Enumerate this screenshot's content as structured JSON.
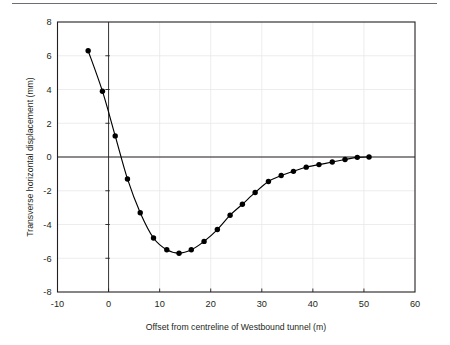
{
  "figure": {
    "top_rule": "horizontal-rule",
    "background_color": "#ffffff"
  },
  "chart_data": {
    "type": "line",
    "title": "",
    "subtitle": "",
    "xlabel": "Offset from centreline of Westbound tunnel (m)",
    "ylabel": "Transverse horizontal displacement (mm)",
    "xlim": [
      -10,
      60
    ],
    "ylim": [
      -8,
      8
    ],
    "xticks": [
      -10,
      0,
      10,
      20,
      30,
      40,
      50,
      60
    ],
    "xtick_labels": [
      "-10",
      "0",
      "10",
      "20",
      "30",
      "40",
      "50",
      "60"
    ],
    "yticks": [
      -8,
      -6,
      -4,
      -2,
      0,
      2,
      4,
      6,
      8
    ],
    "ytick_labels": [
      "-8",
      "-6",
      "-4",
      "-2",
      "0",
      "2",
      "4",
      "6",
      "8"
    ],
    "grid": true,
    "grid_color": "#e8e8e8",
    "legend": "none",
    "series": [
      {
        "name": "Transverse horizontal displacement",
        "marker": "filled-circle",
        "marker_color": "#000000",
        "line_color": "#000000",
        "x": [
          -4.0,
          -1.2,
          1.3,
          3.7,
          6.2,
          8.8,
          11.4,
          13.8,
          16.2,
          18.7,
          21.3,
          23.8,
          26.2,
          28.7,
          31.3,
          33.8,
          36.2,
          38.7,
          41.2,
          43.8,
          46.3,
          48.7,
          51.0
        ],
        "y": [
          6.3,
          3.9,
          1.25,
          -1.3,
          -3.3,
          -4.8,
          -5.5,
          -5.7,
          -5.5,
          -5.0,
          -4.3,
          -3.45,
          -2.8,
          -2.1,
          -1.45,
          -1.1,
          -0.85,
          -0.6,
          -0.45,
          -0.3,
          -0.15,
          -0.02,
          0.0
        ]
      }
    ]
  },
  "axes": {
    "x_axis_label": "Offset from centreline of Westbound tunnel (m)",
    "y_axis_label": "Transverse horizontal displacement (mm)",
    "zero_line_horizontal": "y=0",
    "zero_line_vertical": "x=0"
  }
}
